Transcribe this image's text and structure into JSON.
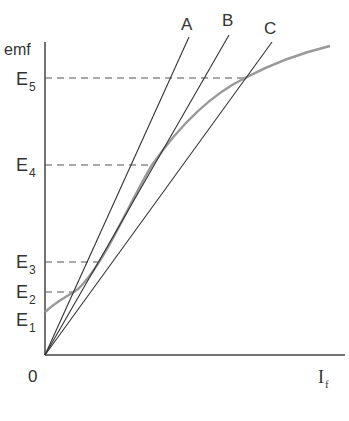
{
  "diagram": {
    "title": "",
    "axes": {
      "y_label": "emf",
      "x_label_main": "I",
      "x_label_sub": "f",
      "origin_label": "0"
    },
    "emf_levels": [
      {
        "main": "E",
        "sub": "5",
        "y": 78
      },
      {
        "main": "E",
        "sub": "4",
        "y": 165
      },
      {
        "main": "E",
        "sub": "3",
        "y": 262
      },
      {
        "main": "E",
        "sub": "2",
        "y": 292
      },
      {
        "main": "E",
        "sub": "1",
        "y": 320
      }
    ],
    "lines": [
      {
        "label": "A",
        "description": "field resistance line A (steepest)"
      },
      {
        "label": "B",
        "description": "field resistance line B (critical, tangent)"
      },
      {
        "label": "C",
        "description": "field resistance line C"
      }
    ],
    "curve": {
      "description": "magnetization (open-circuit) characteristic"
    },
    "colors": {
      "axis": "#444444",
      "line": "#333333",
      "curve": "#999999",
      "dashed": "#555555"
    }
  }
}
